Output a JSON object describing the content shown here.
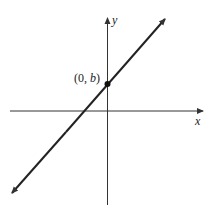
{
  "diagram": {
    "type": "cartesian-line-graph",
    "x_axis_label": "x",
    "y_axis_label": "y",
    "point_label_prefix": "(0, ",
    "point_label_var": "b",
    "point_label_suffix": ")",
    "line_color": "#222222",
    "axis_color": "#333333"
  }
}
